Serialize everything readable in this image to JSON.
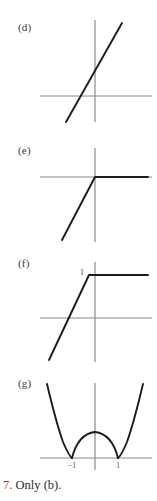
{
  "page": {
    "width": 157,
    "height": 501,
    "background": "#ffffff",
    "axis_color": "#8a8a8a",
    "curve_color": "#1c1c1c",
    "label_color": "#3a3a3a",
    "tick_label_color": "#4a4a4a"
  },
  "panels": [
    {
      "id": "d",
      "label": "(d)",
      "label_x": 18,
      "label_y": 22,
      "description": "straight line through origin with positive slope",
      "curve_type": "line",
      "axes": {
        "x_axis_y": 96,
        "y_axis_x": 95,
        "x_min": 40,
        "x_max": 152,
        "y_min": 20,
        "y_max": 122
      },
      "tick_labels": []
    },
    {
      "id": "e",
      "label": "(e)",
      "label_x": 18,
      "label_y": 145,
      "description": "ramp rising from lower-left to origin then constant zero to the right",
      "curve_type": "piecewise-linear",
      "axes": {
        "x_axis_y": 177,
        "y_axis_x": 95,
        "x_min": 40,
        "x_max": 152,
        "y_min": 148,
        "y_max": 242
      },
      "tick_labels": []
    },
    {
      "id": "f",
      "label": "(f)",
      "label_x": 18,
      "label_y": 258,
      "description": "steep ramp rising to a plateau at height one, then constant",
      "curve_type": "piecewise-linear",
      "axes": {
        "x_axis_y": 318,
        "y_axis_x": 95,
        "x_min": 40,
        "x_max": 152,
        "y_min": 262,
        "y_max": 362
      },
      "tick_labels": [
        {
          "text": "1",
          "x": 85,
          "y": 275,
          "axis": "y"
        }
      ]
    },
    {
      "id": "g",
      "label": "(g)",
      "label_x": 18,
      "label_y": 378,
      "description": "absolute value of x squared minus one, cusps at minus one and one",
      "curve_type": "curve",
      "axes": {
        "x_axis_y": 458,
        "y_axis_x": 95,
        "x_min": 40,
        "x_max": 152,
        "y_min": 383,
        "y_max": 470
      },
      "tick_labels": [
        {
          "text": "−1",
          "x": 70,
          "y": 466,
          "axis": "x"
        },
        {
          "text": "1",
          "x": 121,
          "y": 466,
          "axis": "x"
        }
      ]
    }
  ],
  "answer": {
    "number": "7.",
    "text": "Only (b).",
    "number_color": "#9e3b35"
  }
}
